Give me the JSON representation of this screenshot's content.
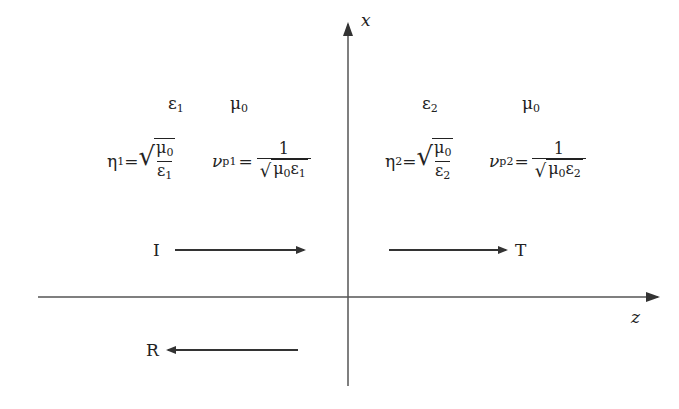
{
  "diagram": {
    "axes": {
      "vertical_label": "x",
      "horizontal_label": "z"
    },
    "region1": {
      "permittivity": "ε",
      "permittivity_sub": "1",
      "permeability": "μ",
      "permeability_sub": "0",
      "impedance": {
        "symbol": "η",
        "sub": "1",
        "equals": "=",
        "numerator": "μ",
        "numerator_sub": "0",
        "denominator": "ε",
        "denominator_sub": "1"
      },
      "phase_velocity": {
        "symbol": "ν",
        "sub": "p1",
        "equals": "=",
        "numerator": "1",
        "denominator_mu": "μ",
        "denominator_mu_sub": "0",
        "denominator_eps": "ε",
        "denominator_eps_sub": "1"
      }
    },
    "region2": {
      "permittivity": "ε",
      "permittivity_sub": "2",
      "permeability": "μ",
      "permeability_sub": "0",
      "impedance": {
        "symbol": "η",
        "sub": "2",
        "equals": "=",
        "numerator": "μ",
        "numerator_sub": "0",
        "denominator": "ε",
        "denominator_sub": "2"
      },
      "phase_velocity": {
        "symbol": "ν",
        "sub": "p2",
        "equals": "=",
        "numerator": "1",
        "denominator_mu": "μ",
        "denominator_mu_sub": "0",
        "denominator_eps": "ε",
        "denominator_eps_sub": "2"
      }
    },
    "waves": {
      "incident": "I",
      "reflected": "R",
      "transmitted": "T"
    },
    "colors": {
      "line": "#333333",
      "text": "#222222",
      "background": "#ffffff"
    }
  }
}
